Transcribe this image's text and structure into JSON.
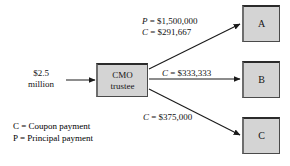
{
  "diagram": {
    "type": "flow-diagram",
    "source_node": {
      "name": "input-amount",
      "line1": "$2.5",
      "line2": "million"
    },
    "central_node": {
      "name": "cmo-trustee",
      "line1": "CMO",
      "line2": "trustee"
    },
    "tranches": [
      {
        "id": "a",
        "label": "A"
      },
      {
        "id": "b",
        "label": "B"
      },
      {
        "id": "c",
        "label": "C"
      }
    ],
    "edge_labels": {
      "to_a_principal": "P = $1,500,000",
      "to_a_coupon": "C = $291,667",
      "to_b_coupon": "C = $333,333",
      "to_c_coupon": "C = $375,000"
    },
    "legend": [
      "C = Coupon payment",
      "P = Principal payment"
    ],
    "colors": {
      "box_fill": "#d4d4d4",
      "box_border": "#4a4a4a",
      "arrow": "#1a1a1a",
      "text": "#111111",
      "background": "#ffffff"
    }
  }
}
